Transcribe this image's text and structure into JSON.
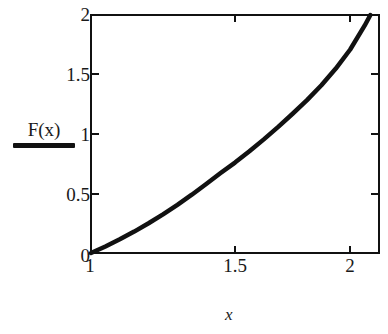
{
  "chart_data": {
    "type": "line",
    "title": "",
    "xlabel": "x",
    "ylabel": "F(x)",
    "xlim": [
      1,
      2
    ],
    "ylim": [
      0,
      2
    ],
    "grid": false,
    "legend_position": "left-outside",
    "x_ticks": [
      "1",
      "1.5",
      "2"
    ],
    "x_tick_values": [
      1,
      1.5,
      2
    ],
    "y_ticks": [
      "0",
      "0.5",
      "1",
      "1.5",
      "2"
    ],
    "y_tick_values": [
      0,
      0.5,
      1,
      1.5,
      2
    ],
    "series": [
      {
        "name": "F(x)",
        "color": "#111111",
        "x": [
          1.0,
          1.05,
          1.1,
          1.15,
          1.2,
          1.25,
          1.3,
          1.35,
          1.4,
          1.45,
          1.5,
          1.55,
          1.6,
          1.65,
          1.7,
          1.75,
          1.8,
          1.85,
          1.9,
          1.95,
          1.97
        ],
        "values": [
          0.0,
          0.055,
          0.115,
          0.18,
          0.25,
          0.325,
          0.405,
          0.49,
          0.58,
          0.672,
          0.76,
          0.855,
          0.955,
          1.06,
          1.17,
          1.285,
          1.41,
          1.55,
          1.71,
          1.91,
          2.0
        ]
      }
    ]
  },
  "labels": {
    "legend_label": "F(x)",
    "x_axis_title": "x",
    "y_tick_0": "0",
    "y_tick_05": "0.5",
    "y_tick_1": "1",
    "y_tick_15": "1.5",
    "y_tick_2": "2",
    "x_tick_1": "1",
    "x_tick_15": "1.5",
    "x_tick_2": "2"
  }
}
